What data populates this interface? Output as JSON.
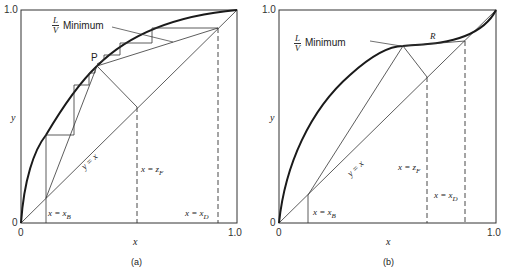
{
  "panels": [
    {
      "id": "a",
      "caption": "(a)",
      "x_axis_label": "x",
      "y_axis_label": "y",
      "tick_origin_x": "0",
      "tick_origin_y": "0",
      "tick_max_x": "1.0",
      "tick_max_y": "1.0",
      "min_ratio_num": "L",
      "min_ratio_den": "V",
      "min_ratio_text": "Minimum",
      "pinch_label": "P",
      "diag_label": "y = x",
      "xb_label": "x = x",
      "xb_sub": "B",
      "zf_label": "x = z",
      "zf_sub": "F",
      "xd_label": "x = x",
      "xd_sub": "D"
    },
    {
      "id": "b",
      "caption": "(b)",
      "x_axis_label": "x",
      "y_axis_label": "y",
      "tick_origin_x": "0",
      "tick_origin_y": "0",
      "tick_max_x": "1.0",
      "tick_max_y": "1.0",
      "min_ratio_num": "L",
      "min_ratio_den": "V",
      "min_ratio_text": "Minimum",
      "pinch_label": "R",
      "diag_label": "y = x",
      "xb_label": "x = x",
      "xb_sub": "B",
      "zf_label": "x = z",
      "zf_sub": "F",
      "xd_label": "x = x",
      "xd_sub": "D"
    }
  ],
  "colors": {
    "line": "#333333",
    "curve": "#1a1a1a",
    "background": "#ffffff"
  }
}
